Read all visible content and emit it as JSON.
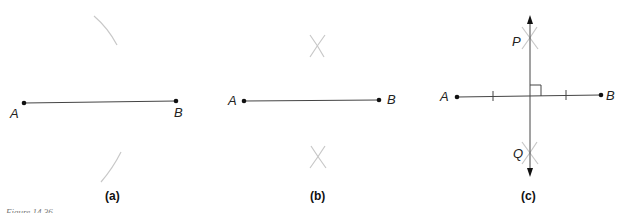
{
  "figure": {
    "caption": "Figure 14.36",
    "panels": [
      {
        "id": "a",
        "label": "(a)",
        "points": [
          {
            "name": "A"
          },
          {
            "name": "B"
          }
        ],
        "description": "Segment AB with compass arcs drawn above and below from point A"
      },
      {
        "id": "b",
        "label": "(b)",
        "points": [
          {
            "name": "A"
          },
          {
            "name": "B"
          }
        ],
        "description": "Segment AB with intersecting arcs above and below"
      },
      {
        "id": "c",
        "label": "(c)",
        "points": [
          {
            "name": "A"
          },
          {
            "name": "B"
          },
          {
            "name": "P"
          },
          {
            "name": "Q"
          }
        ],
        "description": "Perpendicular bisector PQ of segment AB with right-angle mark and equal-length tick marks"
      }
    ]
  },
  "colors": {
    "segment": "#444444",
    "arc": "#c8c8c8",
    "point": "#111111"
  }
}
